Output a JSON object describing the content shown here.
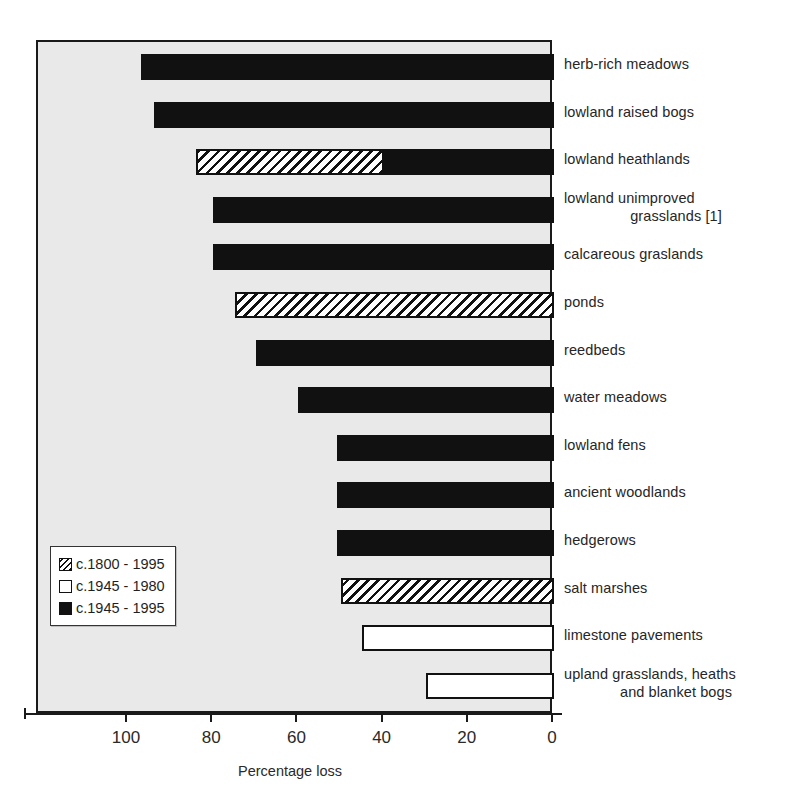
{
  "chart_data": {
    "type": "bar",
    "orientation": "horizontal",
    "title": "",
    "xlabel": "Percentage loss",
    "ylabel": "",
    "xlim": [
      120,
      0
    ],
    "xticks": [
      100,
      80,
      60,
      40,
      20,
      0
    ],
    "xtick_labels": [
      "100",
      "80",
      "60",
      "40",
      "20",
      "0"
    ],
    "grid": false,
    "axis_direction": "reversed",
    "legend_position": "lower-left inside plot",
    "legend": [
      {
        "key": "hatch",
        "label": "c.1800 - 1995",
        "style": "diagonal-hatch"
      },
      {
        "key": "open",
        "label": "c.1945 - 1980",
        "style": "white-fill"
      },
      {
        "key": "solid",
        "label": "c.1945 - 1995",
        "style": "black-fill"
      }
    ],
    "categories": [
      "herb-rich meadows",
      "lowland raised bogs",
      "lowland heathlands",
      "lowland unimproved grasslands [1]",
      "calcareous graslands",
      "ponds",
      "reedbeds",
      "water meadows",
      "lowland fens",
      "ancient woodlands",
      "hedgerows",
      "salt marshes",
      "limestone pavements",
      "upland grasslands, heaths and blanket bogs"
    ],
    "bars": [
      {
        "category": "herb-rich meadows",
        "label_lines": [
          "herb-rich meadows"
        ],
        "segments": [
          {
            "series": "solid",
            "from": 97,
            "to": 0
          }
        ],
        "total": 97
      },
      {
        "category": "lowland raised bogs",
        "label_lines": [
          "lowland raised bogs"
        ],
        "segments": [
          {
            "series": "solid",
            "from": 94,
            "to": 0
          }
        ],
        "total": 94
      },
      {
        "category": "lowland heathlands",
        "label_lines": [
          "lowland heathlands"
        ],
        "segments": [
          {
            "series": "hatch",
            "from": 84,
            "to": 40
          },
          {
            "series": "solid",
            "from": 40,
            "to": 0
          }
        ],
        "total": 84
      },
      {
        "category": "lowland unimproved grasslands [1]",
        "label_lines": [
          "lowland unimproved",
          "grasslands [1]"
        ],
        "segments": [
          {
            "series": "solid",
            "from": 80,
            "to": 0
          }
        ],
        "total": 80
      },
      {
        "category": "calcareous graslands",
        "label_lines": [
          "calcareous graslands"
        ],
        "segments": [
          {
            "series": "solid",
            "from": 80,
            "to": 0
          }
        ],
        "total": 80
      },
      {
        "category": "ponds",
        "label_lines": [
          "ponds"
        ],
        "segments": [
          {
            "series": "hatch",
            "from": 75,
            "to": 0
          }
        ],
        "total": 75
      },
      {
        "category": "reedbeds",
        "label_lines": [
          "reedbeds"
        ],
        "segments": [
          {
            "series": "solid",
            "from": 70,
            "to": 0
          }
        ],
        "total": 70
      },
      {
        "category": "water meadows",
        "label_lines": [
          "water meadows"
        ],
        "segments": [
          {
            "series": "solid",
            "from": 60,
            "to": 0
          }
        ],
        "total": 60
      },
      {
        "category": "lowland fens",
        "label_lines": [
          "lowland fens"
        ],
        "segments": [
          {
            "series": "solid",
            "from": 51,
            "to": 0
          }
        ],
        "total": 51
      },
      {
        "category": "ancient woodlands",
        "label_lines": [
          "ancient woodlands"
        ],
        "segments": [
          {
            "series": "solid",
            "from": 51,
            "to": 0
          }
        ],
        "total": 51
      },
      {
        "category": "hedgerows",
        "label_lines": [
          "hedgerows"
        ],
        "segments": [
          {
            "series": "solid",
            "from": 51,
            "to": 0
          }
        ],
        "total": 51
      },
      {
        "category": "salt marshes",
        "label_lines": [
          "salt marshes"
        ],
        "segments": [
          {
            "series": "hatch",
            "from": 50,
            "to": 0
          }
        ],
        "total": 50
      },
      {
        "category": "limestone pavements",
        "label_lines": [
          "limestone pavements"
        ],
        "segments": [
          {
            "series": "open",
            "from": 45,
            "to": 0
          }
        ],
        "total": 45
      },
      {
        "category": "upland grasslands, heaths and blanket bogs",
        "label_lines": [
          "upland grasslands, heaths",
          "and blanket bogs"
        ],
        "segments": [
          {
            "series": "open",
            "from": 30,
            "to": 0
          }
        ],
        "total": 30
      }
    ]
  },
  "axis": {
    "title": "Percentage loss",
    "tick_labels": [
      "100",
      "80",
      "60",
      "40",
      "20",
      "0"
    ]
  },
  "legend": {
    "items": [
      {
        "label": "c.1800 - 1995"
      },
      {
        "label": "c.1945 - 1980"
      },
      {
        "label": "c.1945 - 1995"
      }
    ]
  },
  "colors": {
    "plot_background": "#e9e9e9",
    "page_background": "#ffffff",
    "ink": "#111111",
    "text": "#262626"
  }
}
